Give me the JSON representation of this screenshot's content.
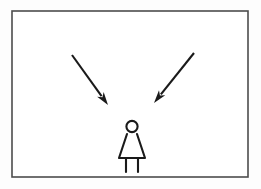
{
  "scene": {
    "title": "Two arrows pointing down toward a standing figure",
    "background_color": "#fdfdfd",
    "canvas": {
      "width": 261,
      "height": 189
    }
  },
  "frame": {
    "label": "Illustration border",
    "x": 12,
    "y": 11,
    "width": 236,
    "height": 166,
    "stroke_color": "#4d4d4d",
    "fill_color": "#ffffff",
    "stroke_width": 1.6
  },
  "arrows": [
    {
      "name": "left-arrow",
      "label": "Left arrow pointing down-right",
      "direction": "down-right",
      "tail_x": 72,
      "tail_y": 55,
      "tip_x": 108,
      "tip_y": 105,
      "color": "#1a1a1a",
      "stroke_width": 2.1,
      "head_length": 13,
      "head_width": 8
    },
    {
      "name": "right-arrow",
      "label": "Right arrow pointing down-left",
      "direction": "down-left",
      "tail_x": 194,
      "tail_y": 53,
      "tip_x": 154,
      "tip_y": 103,
      "color": "#1a1a1a",
      "stroke_width": 2.1,
      "head_length": 13,
      "head_width": 8
    }
  ],
  "figure": {
    "name": "stick-figure-person",
    "label": "Stick figure of a person in a dress",
    "color": "#1a1a1a",
    "stroke_width": 2.1,
    "head": {
      "cx": 132,
      "cy": 126.5,
      "r": 5.6
    },
    "dress": {
      "top_left_x": 127,
      "top_right_x": 137,
      "top_y": 134,
      "bottom_left_x": 119,
      "bottom_right_x": 145,
      "bottom_y": 158
    },
    "legs": [
      {
        "name": "left-leg",
        "x": 126,
        "y1": 158,
        "y2": 172
      },
      {
        "name": "right-leg",
        "x": 138,
        "y1": 158,
        "y2": 172
      }
    ]
  }
}
